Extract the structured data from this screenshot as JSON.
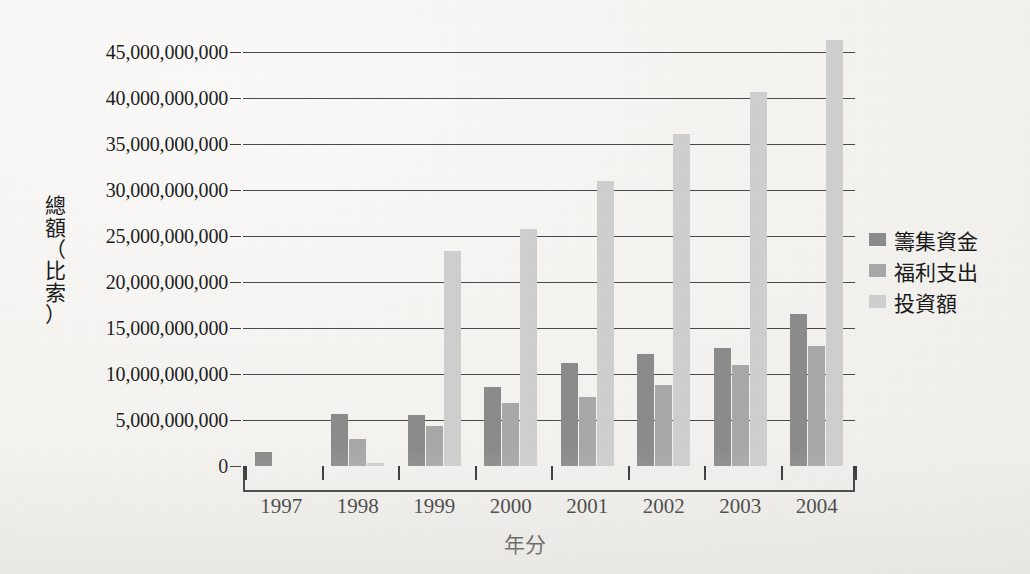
{
  "chart_data": {
    "type": "bar",
    "title": "",
    "xlabel": "年分",
    "ylabel": "總額（比索）",
    "ylabel_chars": [
      "總",
      "額",
      "（",
      "比",
      "索",
      "）"
    ],
    "categories": [
      "1997",
      "1998",
      "1999",
      "2000",
      "2001",
      "2002",
      "2003",
      "2004"
    ],
    "series": [
      {
        "name": "籌集資金",
        "color": "#8c8c8c",
        "values": [
          1500000000,
          5600000000,
          5500000000,
          8600000000,
          11200000000,
          12200000000,
          12800000000,
          16500000000
        ]
      },
      {
        "name": "福利支出",
        "color": "#a9a9a9",
        "values": [
          0,
          2900000000,
          4400000000,
          6900000000,
          7500000000,
          8800000000,
          11000000000,
          13000000000
        ]
      },
      {
        "name": "投資額",
        "color": "#cfcfcf",
        "values": [
          0,
          300000000,
          23400000000,
          25800000000,
          31000000000,
          36100000000,
          40700000000,
          46300000000
        ]
      }
    ],
    "ylim": [
      0,
      45000000000
    ],
    "ytick_values": [
      0,
      5000000000,
      10000000000,
      15000000000,
      20000000000,
      25000000000,
      30000000000,
      35000000000,
      40000000000,
      45000000000
    ],
    "ytick_labels": [
      "0",
      "5,000,000,000",
      "10,000,000,000",
      "15,000,000,000",
      "20,000,000,000",
      "25,000,000,000",
      "30,000,000,000",
      "35,000,000,000",
      "40,000,000,000",
      "45,000,000,000"
    ],
    "grid": true,
    "legend_position": "right",
    "background_color": "#f4f3f0",
    "axis_color": "#2e2e2e"
  },
  "legend": {
    "items": [
      {
        "label": "籌集資金",
        "color": "#8c8c8c"
      },
      {
        "label": "福利支出",
        "color": "#a9a9a9"
      },
      {
        "label": "投資額",
        "color": "#cfcfcf"
      }
    ]
  }
}
